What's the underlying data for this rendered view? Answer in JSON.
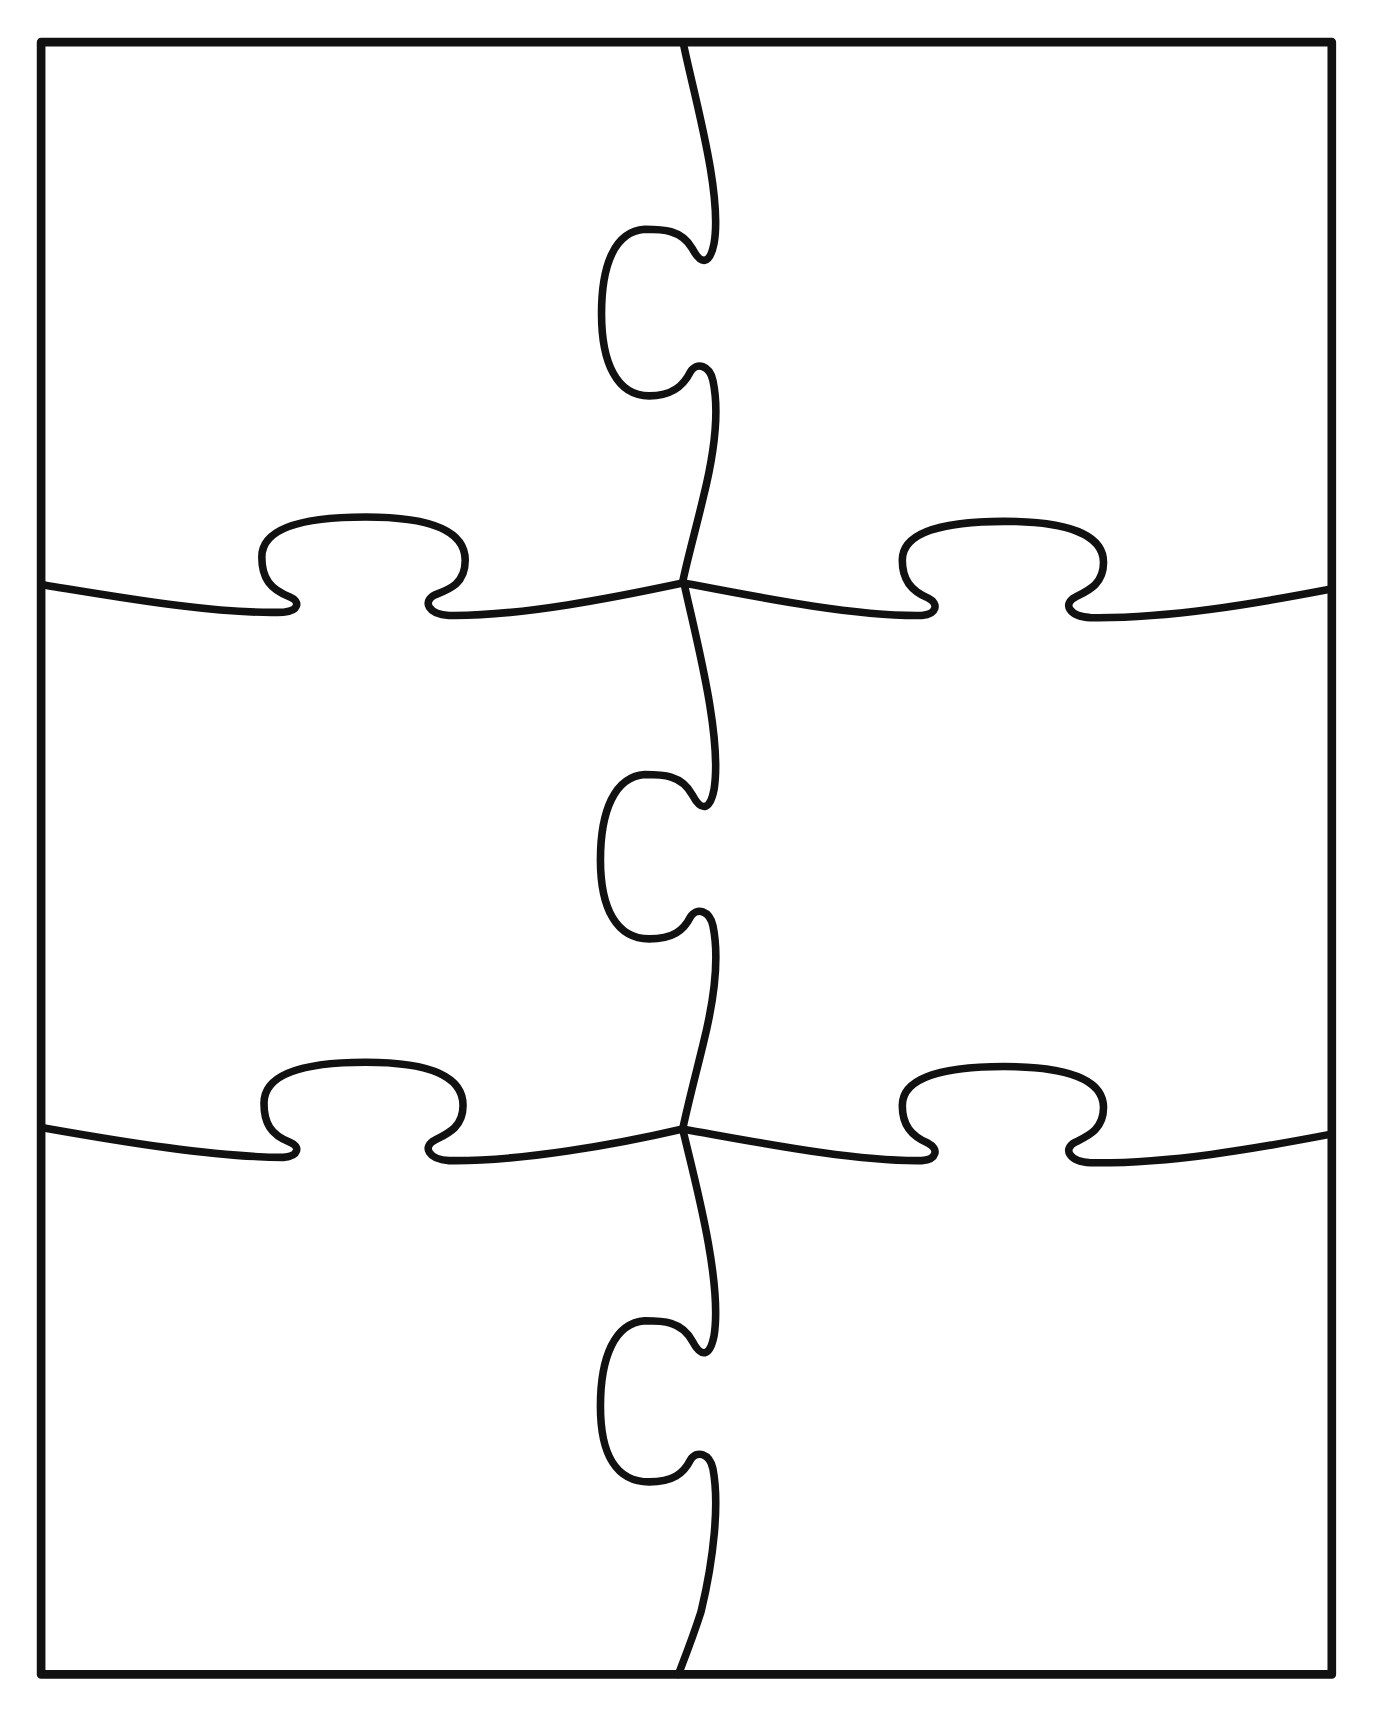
{
  "page": {
    "caption_partial": "y  g  p  p  p  y  g  p  p",
    "caption_note": "clipped text at top edge; only descenders visible"
  },
  "puzzle": {
    "title": "Blank 6-piece jigsaw puzzle template",
    "grid": {
      "columns": 2,
      "rows": 3,
      "piece_count": 6
    },
    "stroke_color": "#111111",
    "background_color": "#ffffff",
    "pieces": [
      {
        "id": "piece-r1-c1",
        "row": 1,
        "col": 1
      },
      {
        "id": "piece-r1-c2",
        "row": 1,
        "col": 2
      },
      {
        "id": "piece-r2-c1",
        "row": 2,
        "col": 1
      },
      {
        "id": "piece-r2-c2",
        "row": 2,
        "col": 2
      },
      {
        "id": "piece-r3-c1",
        "row": 3,
        "col": 1
      },
      {
        "id": "piece-r3-c2",
        "row": 3,
        "col": 2
      }
    ]
  }
}
